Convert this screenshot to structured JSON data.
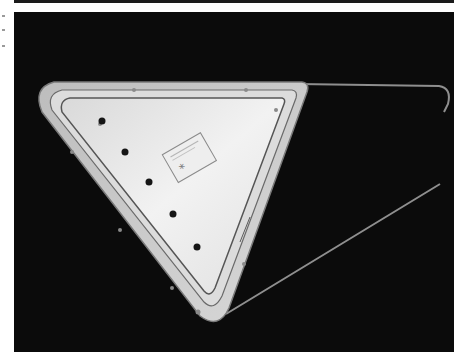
{
  "photo": {
    "subject": "triangular tray panel on black background",
    "background_color": "#0b0b0b",
    "panel_color": "#e6e6e6",
    "rim_color": "#cfcfcf",
    "outline_color": "#9c9c9c",
    "dot_color": "#151515",
    "dots": [
      {
        "cx": 88,
        "cy": 109
      },
      {
        "cx": 111,
        "cy": 140
      },
      {
        "cx": 135,
        "cy": 170
      },
      {
        "cx": 159,
        "cy": 202
      },
      {
        "cx": 183,
        "cy": 235
      }
    ],
    "label": {
      "symbol": "*"
    }
  }
}
